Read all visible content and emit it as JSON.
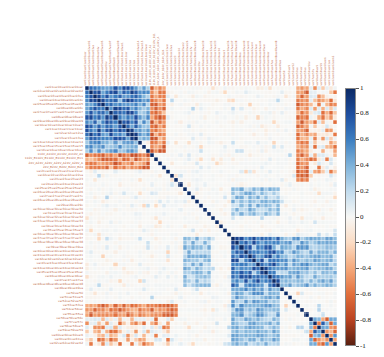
{
  "figure": {
    "type": "correlation-matrix-heatmap",
    "background_color": "#ffffff",
    "width": 384,
    "height": 357
  },
  "colorbar": {
    "name": "correlation-colorbar",
    "orientation": "vertical",
    "vmin": -1,
    "vmax": 1,
    "colormap": "RdBu_r",
    "tick_labels": [
      "1",
      "0.8",
      "0.6",
      "0.4",
      "0.2",
      "0",
      "-0.2",
      "-0.4",
      "-0.6",
      "-0.8",
      "-1"
    ],
    "tick_values": [
      1,
      0.8,
      0.6,
      0.4,
      0.2,
      0,
      -0.2,
      -0.4,
      -0.6,
      -0.8,
      -1
    ],
    "stops": [
      {
        "value": 1,
        "color": "#0b2a66"
      },
      {
        "value": 0.8,
        "color": "#1f4fa0"
      },
      {
        "value": 0.6,
        "color": "#3d7fc1"
      },
      {
        "value": 0.4,
        "color": "#7fb3da"
      },
      {
        "value": 0.2,
        "color": "#c2dcee"
      },
      {
        "value": 0,
        "color": "#f7f7f5"
      },
      {
        "value": -0.2,
        "color": "#fbdcc4"
      },
      {
        "value": -0.4,
        "color": "#f4a97b"
      },
      {
        "value": -0.6,
        "color": "#e2703d"
      },
      {
        "value": -0.8,
        "color": "#bb4422"
      },
      {
        "value": -1,
        "color": "#5a2010"
      }
    ]
  },
  "chart_data": {
    "type": "heatmap",
    "title": "",
    "xlabel": "",
    "ylabel": "",
    "grid": false,
    "legend_position": "right",
    "zlim": [
      -1,
      1
    ],
    "colormap": "RdBu_r",
    "n_rows": 62,
    "n_cols": 62,
    "cell_size_px": 4.06,
    "label_text_color": "#c06a4a",
    "labels_illegible": true,
    "categories": [
      "var01",
      "var02",
      "var03",
      "var04",
      "var05",
      "var06",
      "var07",
      "var08",
      "var09",
      "var10",
      "var11",
      "var12",
      "var13",
      "var14",
      "var15",
      "var16",
      "110V_A",
      "110V_B",
      "24V_A",
      "24V_B",
      "var21",
      "var22",
      "var23",
      "var24",
      "var25",
      "var26",
      "var27",
      "var28",
      "var29",
      "var30",
      "var31",
      "var32",
      "var33",
      "var34",
      "var35",
      "var36",
      "var37",
      "var38",
      "var39",
      "var40",
      "var41",
      "var42",
      "var43",
      "var44",
      "var45",
      "var46",
      "var47",
      "var48",
      "var49",
      "var50",
      "var51",
      "var52",
      "var53",
      "var54",
      "var55",
      "var56",
      "var57",
      "var58",
      "var59",
      "var60",
      "var61",
      "var62"
    ],
    "blocks": [
      {
        "name": "cluster-A-positive",
        "rows": [
          0,
          12
        ],
        "cols": [
          0,
          12
        ],
        "typical_value": 0.62,
        "color": "#4b84c4"
      },
      {
        "name": "cluster-A-row-band",
        "rows": [
          13,
          15
        ],
        "cols": [
          0,
          12
        ],
        "typical_value": 0.42,
        "color": "#8fbddf"
      },
      {
        "name": "negative-band-110V-24V",
        "rows": [
          16,
          19
        ],
        "cols": [
          0,
          15
        ],
        "typical_value": -0.52,
        "color": "#e8804f"
      },
      {
        "name": "orange-stripe-col53",
        "rows": [
          0,
          22
        ],
        "cols": [
          52,
          54
        ],
        "typical_value": -0.55,
        "color": "#e2703d"
      },
      {
        "name": "cluster-B-positive",
        "rows": [
          36,
          47
        ],
        "cols": [
          36,
          47
        ],
        "typical_value": 0.6,
        "color": "#4b84c4"
      },
      {
        "name": "cluster-B-tail",
        "rows": [
          48,
          54
        ],
        "cols": [
          36,
          47
        ],
        "typical_value": 0.38,
        "color": "#9cc5e2"
      },
      {
        "name": "bottom-right-mixed",
        "rows": [
          55,
          61
        ],
        "cols": [
          55,
          61
        ],
        "typical_value": 0.3,
        "color": "#6fa3d0"
      },
      {
        "name": "diagonal",
        "rows": [
          0,
          61
        ],
        "cols": [
          0,
          61
        ],
        "typical_value": 1.0,
        "color": "#0b2a66"
      }
    ]
  }
}
